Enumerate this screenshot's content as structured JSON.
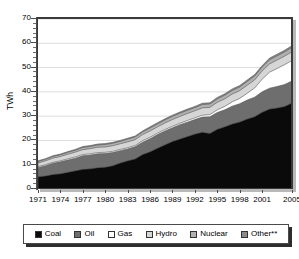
{
  "chart_data": {
    "type": "area",
    "title": "",
    "subtitle": "",
    "xlabel": "",
    "ylabel": "TWh",
    "ylim": [
      0,
      70
    ],
    "ytick_step": 10,
    "yminor_step": 2,
    "grid": true,
    "grid_axis": "y",
    "legend_position": "bottom",
    "stacked": true,
    "xlim": [
      1971,
      2005
    ],
    "x": [
      1971,
      1972,
      1973,
      1974,
      1975,
      1976,
      1977,
      1978,
      1979,
      1980,
      1981,
      1982,
      1983,
      1984,
      1985,
      1986,
      1987,
      1988,
      1989,
      1990,
      1991,
      1992,
      1993,
      1994,
      1995,
      1996,
      1997,
      1998,
      1999,
      2000,
      2001,
      2002,
      2003,
      2004,
      2005
    ],
    "xticks": [
      1971,
      1974,
      1977,
      1980,
      1983,
      1986,
      1989,
      1992,
      1995,
      1998,
      2001,
      2005
    ],
    "xtick_labels": [
      "1971",
      "1974",
      "1977",
      "1980",
      "1983",
      "1986",
      "1989",
      "1992",
      "1995",
      "1998",
      "2001",
      "2005"
    ],
    "yticks": [
      0,
      10,
      20,
      30,
      40,
      50,
      60,
      70
    ],
    "ytick_labels": [
      "0",
      "10",
      "20",
      "30",
      "40",
      "50",
      "60",
      "70"
    ],
    "series": [
      {
        "name": "Coal",
        "color": "#0a0a0a",
        "values": [
          5.0,
          5.4,
          6.0,
          6.3,
          6.9,
          7.5,
          8.1,
          8.3,
          8.8,
          9.0,
          9.6,
          10.7,
          11.6,
          12.4,
          14.2,
          15.3,
          16.8,
          18.2,
          19.6,
          20.6,
          21.6,
          22.6,
          23.4,
          22.9,
          24.6,
          25.6,
          26.8,
          27.6,
          28.8,
          29.8,
          31.6,
          32.9,
          33.4,
          34.0,
          35.4
        ]
      },
      {
        "name": "Oil",
        "color": "#6e6e6e",
        "values": [
          3.8,
          4.2,
          4.6,
          4.9,
          5.0,
          5.2,
          5.6,
          5.7,
          5.7,
          5.6,
          5.4,
          5.1,
          4.9,
          5.0,
          5.1,
          5.4,
          5.6,
          5.7,
          5.6,
          5.9,
          5.9,
          6.0,
          6.2,
          6.8,
          6.9,
          7.0,
          7.3,
          7.5,
          7.8,
          8.0,
          8.4,
          8.6,
          8.8,
          9.0,
          9.1
        ]
      },
      {
        "name": "Gas",
        "color": "#ffffff",
        "values": [
          0.4,
          0.4,
          0.4,
          0.4,
          0.5,
          0.5,
          0.5,
          0.5,
          0.5,
          0.5,
          0.5,
          0.5,
          0.5,
          0.5,
          0.6,
          0.6,
          0.6,
          0.6,
          0.6,
          0.6,
          0.7,
          0.7,
          0.8,
          0.9,
          1.1,
          1.4,
          1.8,
          2.2,
          2.8,
          3.8,
          5.2,
          6.6,
          7.4,
          8.2,
          8.4
        ]
      },
      {
        "name": "Hydro",
        "color": "#d6d6d6",
        "values": [
          1.5,
          1.6,
          1.7,
          1.8,
          1.9,
          2.0,
          2.0,
          2.1,
          2.2,
          2.2,
          2.3,
          2.3,
          2.4,
          2.4,
          2.5,
          2.6,
          2.6,
          2.7,
          2.8,
          2.8,
          2.9,
          2.9,
          3.0,
          3.0,
          3.1,
          3.1,
          3.2,
          3.2,
          3.3,
          3.3,
          3.4,
          3.4,
          3.5,
          3.5,
          3.6
        ]
      },
      {
        "name": "Nuclear",
        "color": "#b0b0b0",
        "values": [
          0.6,
          0.6,
          0.7,
          0.7,
          0.8,
          0.8,
          0.9,
          0.9,
          0.9,
          1.0,
          1.0,
          1.0,
          1.1,
          1.1,
          1.1,
          1.2,
          1.2,
          1.2,
          1.3,
          1.3,
          1.3,
          1.3,
          1.4,
          1.4,
          1.4,
          1.5,
          1.5,
          1.5,
          1.6,
          1.6,
          1.6,
          1.7,
          1.7,
          1.7,
          1.8
        ]
      },
      {
        "name": "Other**",
        "color": "#8a8a8a",
        "values": [
          0.3,
          0.3,
          0.3,
          0.3,
          0.3,
          0.3,
          0.4,
          0.4,
          0.4,
          0.4,
          0.4,
          0.4,
          0.4,
          0.4,
          0.4,
          0.5,
          0.5,
          0.5,
          0.5,
          0.5,
          0.5,
          0.5,
          0.5,
          0.5,
          0.6,
          0.6,
          0.6,
          0.6,
          0.6,
          0.6,
          0.6,
          0.7,
          0.7,
          0.7,
          0.7
        ]
      }
    ]
  },
  "legend": {
    "items": [
      {
        "label": "Coal",
        "color": "#0a0a0a"
      },
      {
        "label": "Oil",
        "color": "#6e6e6e"
      },
      {
        "label": "Gas",
        "color": "#ffffff"
      },
      {
        "label": "Hydro",
        "color": "#d6d6d6"
      },
      {
        "label": "Nuclear",
        "color": "#b0b0b0"
      },
      {
        "label": "Other**",
        "color": "#8a8a8a"
      }
    ]
  },
  "axes": {
    "y_title": "TWh"
  }
}
